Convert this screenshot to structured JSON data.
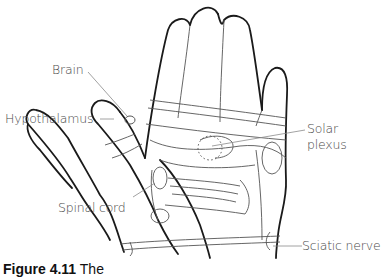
{
  "figure": {
    "labels": {
      "brain": "Brain",
      "hypothalamus": "Hypothalamus",
      "solar_plexus_line1": "Solar",
      "solar_plexus_line2": "plexus",
      "spinal_cord": "Spinal cord",
      "sciatic_nerve": "Sciatic nerve"
    },
    "caption": {
      "figure_number": "Figure 4.11",
      "text": "The",
      "clipped": true
    },
    "colors": {
      "outline": "#1a1a1a",
      "inner_lines": "#555555",
      "label_text": "#4a4a4a",
      "leader_lines": "#8a8a8a"
    }
  }
}
